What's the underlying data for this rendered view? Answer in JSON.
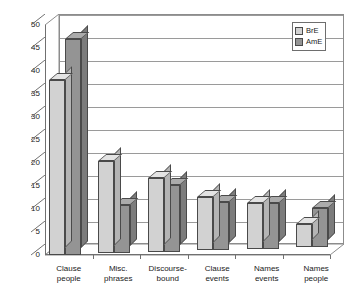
{
  "chart_data": {
    "type": "bar",
    "title": "",
    "subtitle": "",
    "xlabel": "",
    "ylabel": "",
    "categories": [
      "Clause people",
      "Misc. phrases",
      "Discourse-bound",
      "Clause events",
      "Names events",
      "Names people"
    ],
    "category_lines": [
      [
        "Clause",
        "people"
      ],
      [
        "Misc.",
        "phrases"
      ],
      [
        "Discourse-",
        "bound"
      ],
      [
        "Clause",
        "events"
      ],
      [
        "Names",
        "events"
      ],
      [
        "Names",
        "people"
      ]
    ],
    "series": [
      {
        "name": "BrE",
        "values": [
          38,
          20,
          16,
          11.5,
          10,
          5
        ]
      },
      {
        "name": "AmE",
        "values": [
          47,
          10.5,
          14.5,
          10.5,
          10,
          8.5
        ]
      }
    ],
    "ylim": [
      0,
      50
    ],
    "ytick_step": 5,
    "yticks": [
      0,
      5,
      10,
      15,
      20,
      25,
      30,
      35,
      40,
      45,
      50
    ],
    "ytick_labels": [
      "0",
      "5",
      "10",
      "15",
      "20",
      "25",
      "30",
      "35",
      "40",
      "45",
      "50"
    ],
    "grid": true,
    "legend_position": "top-right",
    "style": "3d-column",
    "colors": {
      "bre_fill": "#d2d2d2",
      "bre_top": "#e3e3e3",
      "bre_side": "#b4b4b4",
      "ame_fill": "#949494",
      "ame_top": "#ababab",
      "ame_side": "#7c7c7c",
      "bar_outline": "#4a4a4a",
      "gridline": "#9a9a9a",
      "axis": "#707070",
      "text": "#1a1a1a",
      "background": "#ffffff"
    }
  },
  "legend": {
    "items": [
      {
        "label": "BrE",
        "key": "bre"
      },
      {
        "label": "AmE",
        "key": "ame"
      }
    ]
  }
}
